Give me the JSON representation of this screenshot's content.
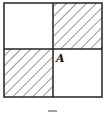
{
  "diagram": {
    "type": "2x2 square grid with hatched diagonal cells",
    "cells": [
      {
        "position": "top-left",
        "hatched": false
      },
      {
        "position": "top-right",
        "hatched": true
      },
      {
        "position": "bottom-left",
        "hatched": true
      },
      {
        "position": "bottom-right",
        "hatched": false
      }
    ],
    "point_label": "A",
    "bottom_mark": "—",
    "colors": {
      "stroke": "#222222",
      "hatch": "#333333",
      "background": "#ffffff"
    }
  }
}
